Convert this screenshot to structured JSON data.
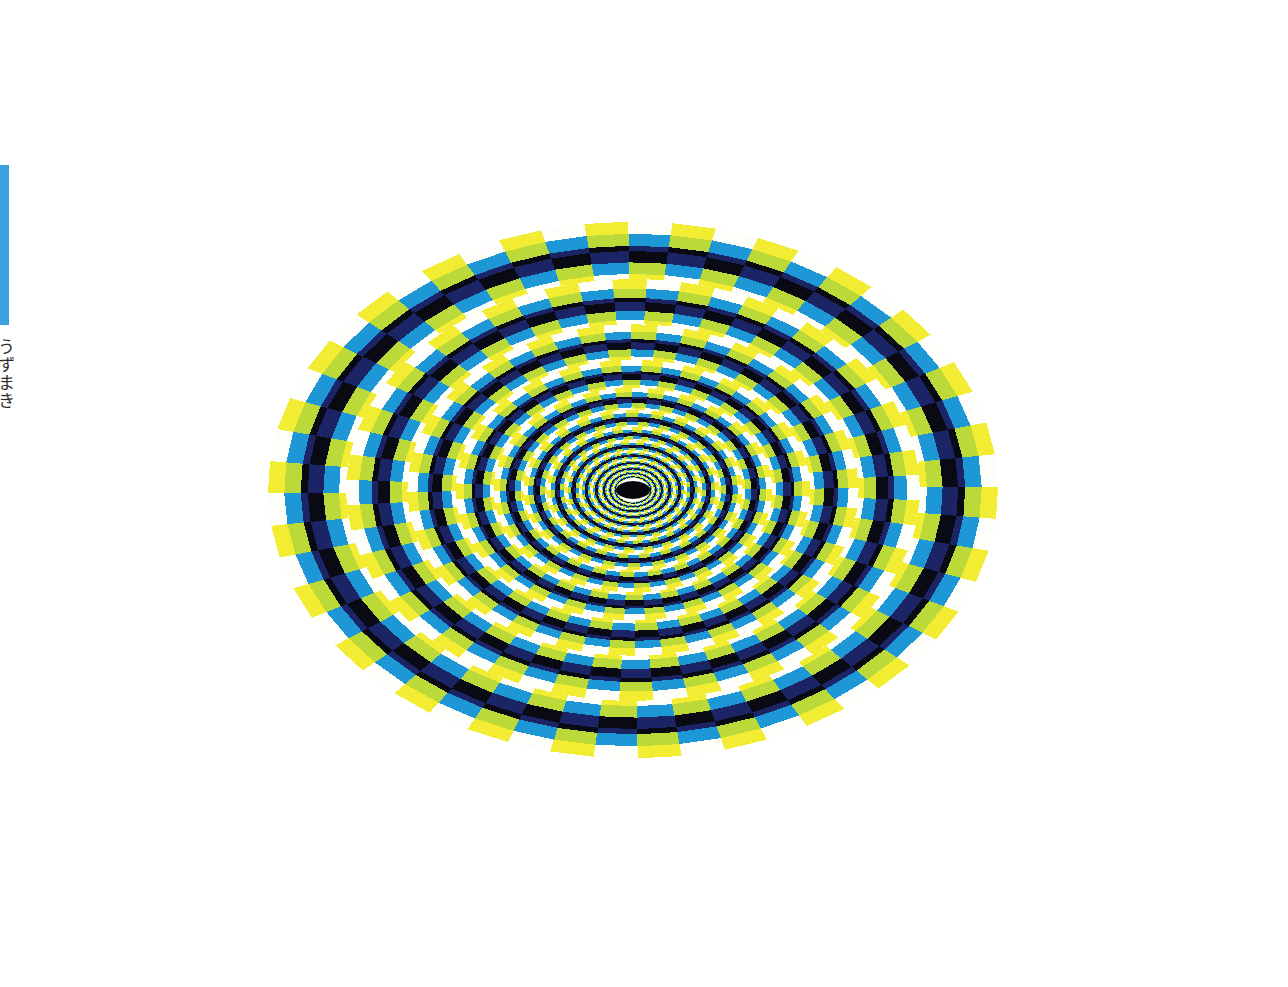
{
  "page": {
    "background": "#ffffff",
    "width": 1288,
    "height": 987,
    "kind": "scanned-book-page"
  },
  "edge_bar": {
    "name": "left-edge-blue-bar",
    "color": "#3aa3dd",
    "x": 0,
    "y": 165,
    "width": 9,
    "height": 160
  },
  "edge_caption": {
    "text": "うずまき",
    "note": "vertical caption cropped at left page edge"
  },
  "plate": {
    "title": "Rotating Snakes style peripheral drift illusion",
    "x": 58,
    "y": 53,
    "width": 1174,
    "height": 867,
    "center": {
      "x": 575,
      "y": 437
    },
    "center_dot": {
      "rx": 17,
      "ry": 9,
      "color": "#08070e"
    },
    "spokes": 52,
    "spoke_rotation_per_ring_deg": 3.4,
    "rings": 13,
    "ring_growth": 1.272,
    "ring_base_radius": 16,
    "aspect_y_over_x": 0.735,
    "band_sequence": [
      "white",
      "cyan",
      "navy",
      "black",
      "yellowgreen",
      "yellow"
    ],
    "band_fractions": [
      0.09,
      0.2,
      0.2,
      0.09,
      0.21,
      0.21
    ],
    "palette": {
      "white": "#fdfdfa",
      "cyan": "#1d97d6",
      "navy": "#1b2464",
      "black": "#090a14",
      "yellowgreen": "#bcd93a",
      "yellow": "#f2ec32"
    }
  },
  "chart_data": {
    "type": "radial-pattern",
    "rings": 13,
    "sectors_per_ring": 52,
    "cell_colour_cycle": [
      "#fdfdfa",
      "#1d97d6",
      "#1b2464",
      "#090a14",
      "#bcd93a",
      "#f2ec32"
    ],
    "geometry": "ellipse, radius ratio 1.272 per ring, 3.4 deg phase shift per ring"
  }
}
